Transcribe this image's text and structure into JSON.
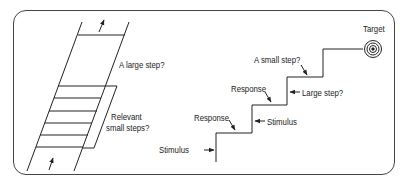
{
  "diagram": {
    "left_panel": {
      "large_step_label": "A large step?",
      "small_steps_label_line1": "Relevant",
      "small_steps_label_line2": "small steps?"
    },
    "right_panel": {
      "target_label": "Target",
      "small_step_label": "A small step?",
      "large_step_label": "Large step?",
      "response_upper_label": "Response",
      "stimulus_upper_label": "Stimulus",
      "response_lower_label": "Response",
      "stimulus_lower_label": "Stimulus"
    },
    "colors": {
      "line": "#222222",
      "frame": "#444444",
      "background": "#ffffff"
    }
  }
}
